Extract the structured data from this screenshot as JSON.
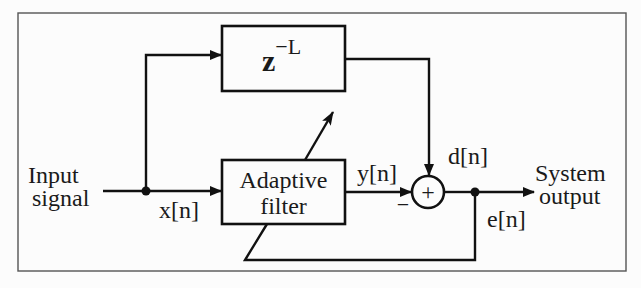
{
  "diagram": {
    "type": "adaptive-linear-prediction-block-diagram",
    "blocks": {
      "delay": {
        "label_base": "z",
        "label_exponent": "−L"
      },
      "adaptive_filter": {
        "line1": "Adaptive",
        "line2": "filter"
      },
      "summer": {
        "symbol": "+",
        "minus_sign": "−"
      }
    },
    "labels": {
      "input_line1": "Input",
      "input_line2": "signal",
      "x": "x[n]",
      "y": "y[n]",
      "d": "d[n]",
      "e": "e[n]",
      "output_line1": "System",
      "output_line2": "output"
    },
    "colors": {
      "line": "#111111",
      "frame": "#555555",
      "background": "#fcfcfc"
    }
  }
}
